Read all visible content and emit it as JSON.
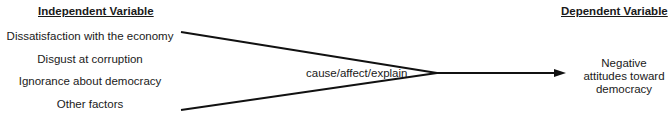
{
  "diagram": {
    "type": "causal-flow",
    "independent": {
      "heading": "Independent Variable",
      "items": [
        "Dissatisfaction with the economy",
        "Disgust at corruption",
        "Ignorance about democracy",
        "Other factors"
      ]
    },
    "relation_label": "cause/affect/explain",
    "dependent": {
      "heading": "Dependent Variable",
      "lines": [
        "Negative",
        "attitudes toward",
        "democracy"
      ]
    },
    "colors": {
      "line": "#111111",
      "text": "#1a1a1a",
      "background": "#ffffff"
    }
  }
}
